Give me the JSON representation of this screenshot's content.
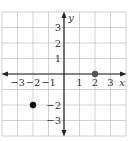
{
  "chart_data": {
    "type": "scatter",
    "title": "",
    "xlabel": "x",
    "ylabel": "y",
    "xlim": [
      -4,
      4
    ],
    "ylim": [
      -4,
      4
    ],
    "grid": true,
    "x_ticks": [
      "-3",
      "-2",
      "-1",
      "1",
      "2",
      "3"
    ],
    "y_ticks": [
      "3",
      "2",
      "1",
      "-2",
      "-3"
    ],
    "points": [
      {
        "x": -2,
        "y": -2,
        "color": "#111111",
        "style": "filled"
      },
      {
        "x": 2,
        "y": 0,
        "color": "#555555",
        "style": "filled"
      }
    ]
  },
  "colors": {
    "grid": "#c8c8c8",
    "axis": "#222222",
    "point_primary": "#111111",
    "point_secondary": "#555555"
  }
}
